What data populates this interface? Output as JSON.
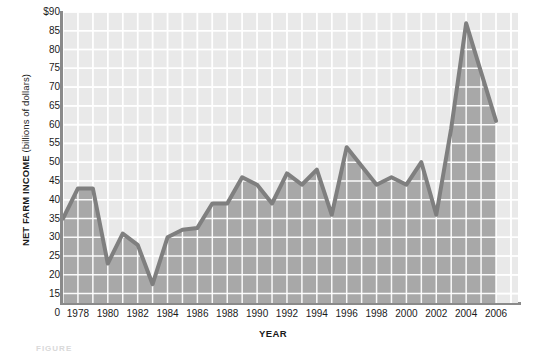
{
  "chart_data": {
    "type": "area",
    "title": "",
    "xlabel": "YEAR",
    "ylabel_bold": "NET FARM INCOME",
    "ylabel_light": " (billions of dollars)",
    "xlim": [
      1977,
      2006
    ],
    "ylim": [
      12.5,
      90
    ],
    "ytick_labels": [
      "$90",
      "85",
      "80",
      "75",
      "70",
      "65",
      "60",
      "55",
      "50",
      "45",
      "40",
      "35",
      "30",
      "25",
      "20",
      "15"
    ],
    "ytick_values": [
      90,
      85,
      80,
      75,
      70,
      65,
      60,
      55,
      50,
      45,
      40,
      35,
      30,
      25,
      20,
      15
    ],
    "yzero_label": "0",
    "xtick_labels": [
      "1978",
      "1980",
      "1982",
      "1984",
      "1986",
      "1988",
      "1990",
      "1992",
      "1994",
      "1996",
      "1998",
      "2000",
      "2002",
      "2004",
      "2006"
    ],
    "xtick_values": [
      1978,
      1980,
      1982,
      1984,
      1986,
      1988,
      1990,
      1992,
      1994,
      1996,
      1998,
      2000,
      2002,
      2004,
      2006
    ],
    "grid": true,
    "legend": "none",
    "x": [
      1977,
      1978,
      1979,
      1980,
      1981,
      1982,
      1983,
      1984,
      1985,
      1986,
      1987,
      1988,
      1989,
      1990,
      1991,
      1992,
      1993,
      1994,
      1995,
      1996,
      1997,
      1998,
      1999,
      2000,
      2001,
      2002,
      2003,
      2004,
      2005,
      2006
    ],
    "values": [
      35,
      43,
      43,
      23,
      31,
      28,
      17.5,
      30,
      32,
      32.5,
      39,
      39,
      46,
      44,
      39,
      47,
      44,
      48,
      36,
      54,
      49,
      44,
      46,
      44,
      50,
      36,
      59,
      87,
      74,
      61
    ],
    "series_name": "Net farm income",
    "fill_color": "#a8a8a8",
    "line_color": "#7f7f7f",
    "plot_bg_color": "#e9e9e9",
    "grid_color": "#ffffff",
    "axis_color": "#8a8a8a"
  },
  "caption": "FIGURE"
}
